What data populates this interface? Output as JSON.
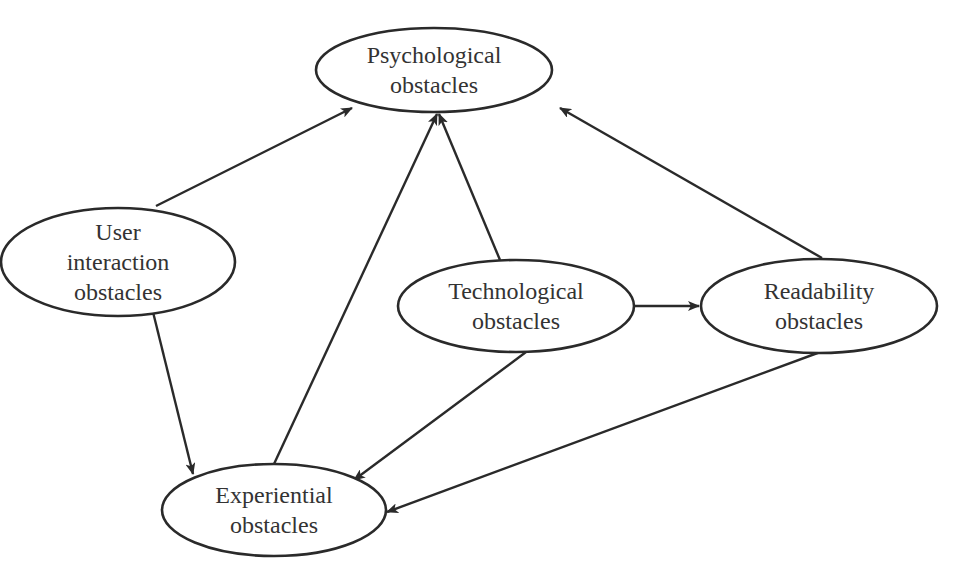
{
  "diagram": {
    "type": "directed-graph",
    "nodes": [
      {
        "id": "psychological",
        "lines": [
          "Psychological",
          "obstacles"
        ],
        "cx": 434,
        "cy": 70,
        "rx": 118,
        "ry": 42
      },
      {
        "id": "user_interaction",
        "lines": [
          "User",
          "interaction",
          "obstacles"
        ],
        "cx": 118,
        "cy": 262,
        "rx": 117,
        "ry": 54
      },
      {
        "id": "technological",
        "lines": [
          "Technological",
          "obstacles"
        ],
        "cx": 516,
        "cy": 306,
        "rx": 118,
        "ry": 46
      },
      {
        "id": "readability",
        "lines": [
          "Readability",
          "obstacles"
        ],
        "cx": 819,
        "cy": 306,
        "rx": 118,
        "ry": 47
      },
      {
        "id": "experiential",
        "lines": [
          "Experiential",
          "obstacles"
        ],
        "cx": 274,
        "cy": 510,
        "rx": 112,
        "ry": 46
      }
    ],
    "edges": [
      {
        "from": "user_interaction",
        "to": "psychological",
        "x1": 156,
        "y1": 206,
        "x2": 352,
        "y2": 108
      },
      {
        "from": "technological",
        "to": "psychological",
        "x1": 500,
        "y1": 260,
        "x2": 439,
        "y2": 114
      },
      {
        "from": "readability",
        "to": "psychological",
        "x1": 822,
        "y1": 258,
        "x2": 560,
        "y2": 108
      },
      {
        "from": "experiential",
        "to": "psychological",
        "x1": 274,
        "y1": 464,
        "x2": 437,
        "y2": 114
      },
      {
        "from": "user_interaction",
        "to": "experiential",
        "x1": 153,
        "y1": 312,
        "x2": 193,
        "y2": 474
      },
      {
        "from": "technological",
        "to": "readability",
        "x1": 634,
        "y1": 306,
        "x2": 699,
        "y2": 306
      },
      {
        "from": "technological",
        "to": "experiential",
        "x1": 526,
        "y1": 352,
        "x2": 354,
        "y2": 480
      },
      {
        "from": "readability",
        "to": "experiential",
        "x1": 823,
        "y1": 351,
        "x2": 387,
        "y2": 512
      }
    ],
    "colors": {
      "stroke": "#2a2a2a",
      "text": "#333333",
      "background": "#ffffff"
    }
  }
}
